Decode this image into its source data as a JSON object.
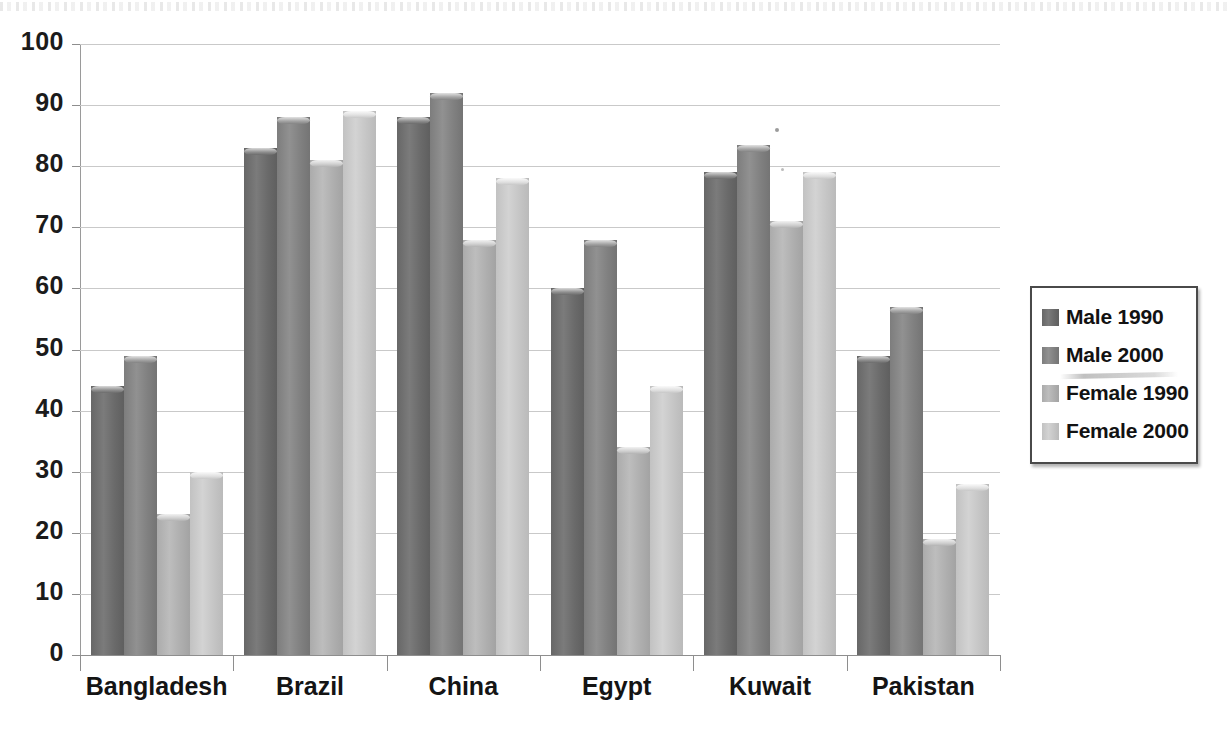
{
  "chart_data": {
    "type": "bar",
    "title": "",
    "subtitle": "",
    "xlabel": "",
    "ylabel": "",
    "ylim": [
      0,
      100
    ],
    "ytick_step": 10,
    "yticks": [
      0,
      10,
      20,
      30,
      40,
      50,
      60,
      70,
      80,
      90,
      100
    ],
    "grid": true,
    "legend_position": "right",
    "categories": [
      "Bangladesh",
      "Brazil",
      "China",
      "Egypt",
      "Kuwait",
      "Pakistan"
    ],
    "series": [
      {
        "name": "Male 1990",
        "color": "#6e6e6e",
        "values": [
          44,
          83,
          88,
          60,
          79,
          49
        ]
      },
      {
        "name": "Male 2000",
        "color": "#868686",
        "values": [
          49,
          88,
          92,
          68,
          83.5,
          57
        ]
      },
      {
        "name": "Female 1990",
        "color": "#b3b3b3",
        "values": [
          23,
          81,
          68,
          34,
          71,
          19
        ]
      },
      {
        "name": "Female 2000",
        "color": "#c9c9c9",
        "values": [
          30,
          89,
          78,
          44,
          79,
          28
        ]
      }
    ]
  },
  "legend": {
    "items": [
      {
        "label": "Male 1990"
      },
      {
        "label": "Male 2000"
      },
      {
        "label": "Female 1990"
      },
      {
        "label": "Female 2000"
      }
    ]
  },
  "axis": {
    "y_labels": [
      "100",
      "90",
      "80",
      "70",
      "60",
      "50",
      "40",
      "30",
      "20",
      "10",
      "0"
    ],
    "x_labels": [
      "Bangladesh",
      "Brazil",
      "China",
      "Egypt",
      "Kuwait",
      "Pakistan"
    ]
  }
}
